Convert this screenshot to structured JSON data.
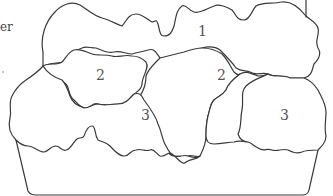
{
  "figure": {
    "type": "planter-diagram",
    "edge_text_fragment": "er",
    "regions": [
      {
        "id": "region-1",
        "label": "1",
        "x": 198,
        "y": 24
      },
      {
        "id": "region-2-left",
        "label": "2",
        "x": 96,
        "y": 68
      },
      {
        "id": "region-2-right",
        "label": "2",
        "x": 217,
        "y": 68
      },
      {
        "id": "region-3-left",
        "label": "3",
        "x": 141,
        "y": 108
      },
      {
        "id": "region-3-right",
        "label": "3",
        "x": 280,
        "y": 108
      }
    ],
    "colors": {
      "stroke": "#3a3a3a",
      "background": "#ffffff",
      "label": "#555555"
    }
  }
}
